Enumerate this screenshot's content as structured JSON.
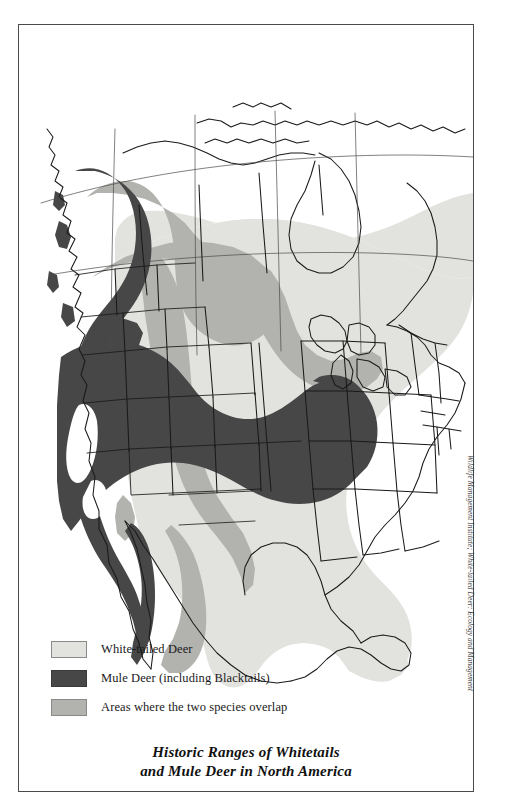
{
  "figure": {
    "title_line1": "Historic Ranges of Whitetails",
    "title_line2": "and Mule Deer in North America",
    "credit": "Wildlife Management Institute; White-tailed Deer: Ecology and Management"
  },
  "legend": {
    "items": [
      {
        "label": "White-tailed Deer",
        "color": "#e2e2df",
        "key": "whitetail"
      },
      {
        "label": "Mule Deer (including  Blacktails)",
        "color": "#474747",
        "key": "muledeer"
      },
      {
        "label": "Areas where the two species overlap",
        "color": "#b2b2ae",
        "key": "overlap"
      }
    ]
  },
  "map": {
    "region": "North America",
    "projection_note": "conic",
    "colors": {
      "whitetail": "#e2e2df",
      "muledeer": "#474747",
      "overlap": "#b2b2ae",
      "unshaded": "#ffffff",
      "outline": "#1a1a1a",
      "border_thin": "#4a4a4a"
    },
    "ranges": [
      {
        "species": "White-tailed Deer",
        "fill": "#e2e2df",
        "description": "Eastern and central North America from southern Canada south through Mexico and Central America"
      },
      {
        "species": "Mule Deer (including Blacktails)",
        "fill": "#474747",
        "description": "Western North America: Pacific coastal strip from southeast Alaska through British Columbia, the Great Basin, California, Nevada, Utah, Arizona, Colorado and Baja California"
      },
      {
        "species": "Areas where the two species overlap",
        "fill": "#b2b2ae",
        "description": "Rocky Mountains, northern Great Plains, Texas hill country, Sierra Madre Occidental and interior British Columbia / Alberta"
      }
    ]
  }
}
